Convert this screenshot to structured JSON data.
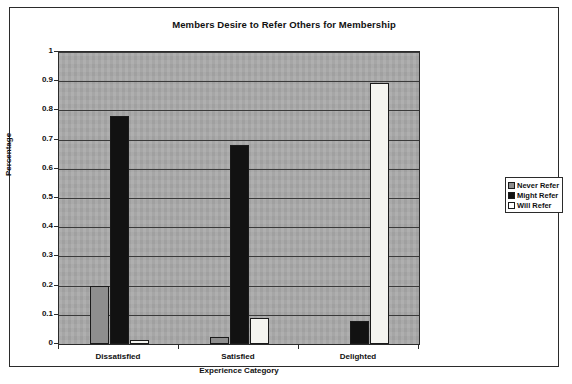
{
  "chart_data": {
    "type": "bar",
    "title": "Members Desire to Refer Others for Membership",
    "xlabel": "Experience Category",
    "ylabel": "Percentage",
    "categories": [
      "Dissatisfied",
      "Satisfied",
      "Delighted"
    ],
    "series": [
      {
        "name": "Never Refer",
        "values": [
          0.2,
          0.025,
          0.0
        ]
      },
      {
        "name": "Might Refer",
        "values": [
          0.78,
          0.68,
          0.08
        ]
      },
      {
        "name": "Will Refer",
        "values": [
          0.015,
          0.09,
          0.895
        ]
      }
    ],
    "ylim": [
      0,
      1
    ],
    "yticks": [
      "0",
      "0.1",
      "0.2",
      "0.3",
      "0.4",
      "0.5",
      "0.6",
      "0.7",
      "0.8",
      "0.9",
      "1"
    ],
    "grid": true,
    "legend_position": "right",
    "plot_background_color": "#a8a8a8",
    "series_colors": [
      "#8e8e8e",
      "#121212",
      "#f4f4f0"
    ]
  }
}
